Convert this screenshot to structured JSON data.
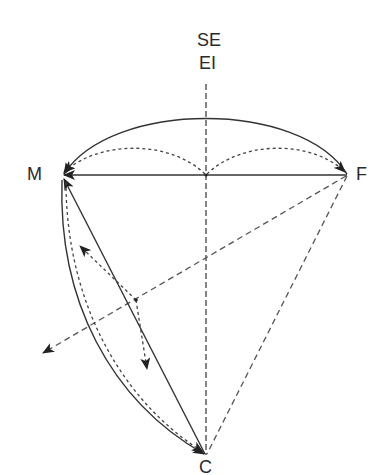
{
  "diagram": {
    "labels": {
      "top_line1": "SE",
      "top_line2": "EI",
      "left": "M",
      "right": "F",
      "bottom": "C"
    },
    "colors": {
      "stroke": "#2a2a2a",
      "dashed": "#555555",
      "background": "#ffffff"
    },
    "nodes": {
      "M": [
        62,
        175
      ],
      "F": [
        347,
        175
      ],
      "C": [
        206,
        455
      ],
      "O": [
        206,
        175
      ],
      "P": [
        135,
        300
      ]
    },
    "edges": [
      {
        "from": "F",
        "to": "M",
        "style": "solid",
        "shape": "arc-top",
        "arrow": "M"
      },
      {
        "from": "F",
        "to": "M",
        "style": "solid",
        "shape": "straight",
        "arrow": "M"
      },
      {
        "from": "O",
        "to": "M",
        "style": "dotted",
        "shape": "arc",
        "arrow": "M"
      },
      {
        "from": "O",
        "to": "F",
        "style": "dotted",
        "shape": "arc",
        "arrow": "F"
      },
      {
        "from": "C",
        "to": "M",
        "style": "solid",
        "shape": "straight",
        "arrow": "M"
      },
      {
        "from": "M",
        "to": "C",
        "style": "solid",
        "shape": "arc-left",
        "arrow": "C"
      },
      {
        "from": "M",
        "to": "C",
        "style": "dotted",
        "shape": "arc-left",
        "arrow": "C"
      },
      {
        "from": "F",
        "to": "C",
        "style": "dashed",
        "shape": "straight",
        "arrow": "none"
      },
      {
        "from": "F",
        "to": "outside-lower-left",
        "style": "dashed",
        "shape": "straight",
        "arrow": "end"
      },
      {
        "from": "P",
        "to": "upper-left-arrow",
        "style": "dotted",
        "shape": "straight",
        "arrow": "end"
      },
      {
        "from": "P",
        "to": "lower-arrow",
        "style": "dotted",
        "shape": "straight",
        "arrow": "end"
      },
      {
        "from": "axis-top",
        "to": "C",
        "style": "dashed",
        "shape": "vertical-axis",
        "arrow": "none"
      }
    ]
  }
}
